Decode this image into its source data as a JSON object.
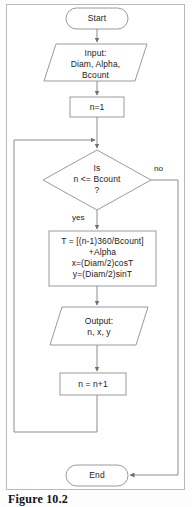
{
  "figure": {
    "caption": "Figure 10.2",
    "border_color": "#b9b9b9",
    "shape_stroke": "#9a9a9a",
    "line_color": "#8d8d8d",
    "text_color": "#1b1b1b",
    "background": "#ffffff"
  },
  "nodes": {
    "start": {
      "label": "Start",
      "shape": "terminator"
    },
    "input": {
      "line1": "Input:",
      "line2": "Diam, Alpha,",
      "line3": "Bcount",
      "shape": "parallelogram"
    },
    "init": {
      "label": "n=1",
      "shape": "process"
    },
    "decision": {
      "line1": "Is",
      "line2": "n <= Bcount",
      "line3": "?",
      "shape": "diamond"
    },
    "compute": {
      "line1": "T = [(n-1)360/Bcount]",
      "line2": "+Alpha",
      "line3": "x=(Diam/2)cosT",
      "line4": "y=(Diam/2)sinT",
      "shape": "process"
    },
    "output": {
      "line1": "Output:",
      "line2": "n, x, y",
      "shape": "parallelogram"
    },
    "increment": {
      "label": "n = n+1",
      "shape": "process"
    },
    "end": {
      "label": "End",
      "shape": "terminator"
    }
  },
  "edge_labels": {
    "yes": "yes",
    "no": "no"
  }
}
